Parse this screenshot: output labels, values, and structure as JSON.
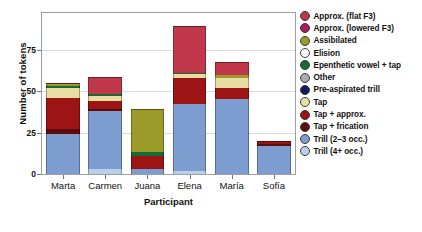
{
  "chart_data": {
    "type": "bar",
    "subtype": "stacked-bar",
    "title": "",
    "xlabel": "Participant",
    "ylabel": "Number of tokens",
    "ylim": [
      0,
      97
    ],
    "yticks": [
      0,
      25,
      50,
      75
    ],
    "ytick_labels": [
      "0",
      "25",
      "50",
      "75"
    ],
    "grid": true,
    "grid_axis": "y",
    "legend_position": "right",
    "categories": [
      "Marta",
      "Carmen",
      "Juana",
      "Elena",
      "María",
      "Sofía"
    ],
    "series": [
      {
        "name": "Trill (4+ occ.)",
        "color": "#b9d0ea",
        "values": [
          0,
          3,
          0,
          2,
          0,
          0
        ]
      },
      {
        "name": "Trill (2–3 occ.)",
        "color": "#7d9dd1",
        "values": [
          24,
          35,
          3,
          40,
          45,
          17
        ]
      },
      {
        "name": "Tap + frication",
        "color": "#5e0b0b",
        "values": [
          3,
          1,
          0,
          0,
          0,
          1
        ]
      },
      {
        "name": "Tap + approx.",
        "color": "#9c1414",
        "values": [
          19,
          5,
          8,
          16,
          7,
          2
        ]
      },
      {
        "name": "Tap",
        "color": "#e9dda4",
        "values": [
          6,
          3,
          0,
          2,
          6,
          0
        ]
      },
      {
        "name": "Pre-aspirated trill",
        "color": "#141a5e",
        "values": [
          0,
          0,
          0,
          0,
          0,
          0
        ]
      },
      {
        "name": "Other",
        "color": "#a8acb0",
        "values": [
          0,
          0,
          0,
          0,
          0,
          0
        ]
      },
      {
        "name": "Epenthetic vowel + tap",
        "color": "#146b33",
        "values": [
          1,
          1.5,
          2,
          1,
          0,
          0
        ]
      },
      {
        "name": "Elision",
        "color": "#ffffff",
        "values": [
          0,
          0,
          0,
          0,
          0,
          0
        ]
      },
      {
        "name": "Assibilated",
        "color": "#9c9a28",
        "values": [
          1,
          0,
          26,
          0,
          1.5,
          0
        ]
      },
      {
        "name": "Approx. (lowered F3)",
        "color": "#a81d5c",
        "values": [
          0,
          0,
          0,
          0,
          0,
          0
        ]
      },
      {
        "name": "Approx. (flat F3)",
        "color": "#c0384a",
        "values": [
          1,
          10,
          0,
          28,
          8,
          0
        ]
      }
    ],
    "totals": [
      55,
      58.5,
      39,
      89,
      67.5,
      20
    ],
    "annotations": []
  },
  "legend": {
    "items": [
      {
        "label": "Approx. (flat F3)",
        "color": "#c0384a"
      },
      {
        "label": "Approx. (lowered F3)",
        "color": "#a81d5c"
      },
      {
        "label": "Assibilated",
        "color": "#9c9a28"
      },
      {
        "label": "Elision",
        "color": "#ffffff"
      },
      {
        "label": "Epenthetic vowel + tap",
        "color": "#146b33"
      },
      {
        "label": "Other",
        "color": "#a8acb0"
      },
      {
        "label": "Pre-aspirated trill",
        "color": "#141a5e"
      },
      {
        "label": "Tap",
        "color": "#e9dda4"
      },
      {
        "label": "Tap + approx.",
        "color": "#9c1414"
      },
      {
        "label": "Tap + frication",
        "color": "#5e0b0b"
      },
      {
        "label": "Trill (2–3 occ.)",
        "color": "#7d9dd1"
      },
      {
        "label": "Trill (4+ occ.)",
        "color": "#b9d0ea"
      }
    ]
  },
  "axes": {
    "y_title": "Number of tokens",
    "x_title": "Participant"
  }
}
